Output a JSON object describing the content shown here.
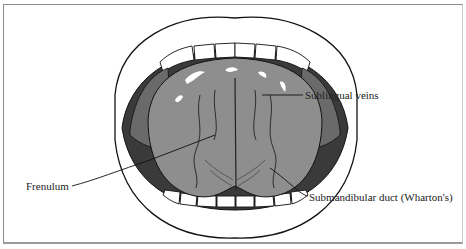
{
  "figure": {
    "labels": {
      "sublingual_veins": "Sublingual veins",
      "frenulum": "Frenulum",
      "submandibular_duct": "Submandibular duct (Wharton's)"
    },
    "colors": {
      "tongue": "#8e8e8e",
      "outline": "#111111",
      "background": "#ffffff",
      "frame": "#8a8a8a"
    }
  }
}
